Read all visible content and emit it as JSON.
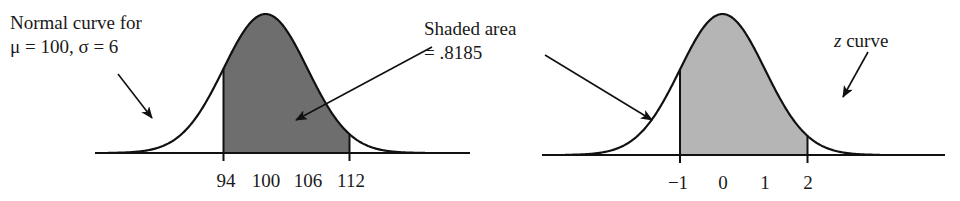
{
  "chart_data": [
    {
      "type": "area",
      "title": "Normal curve for μ = 100, σ = 6",
      "annotation_lines": [
        "Normal curve for",
        "μ = 100, σ = 6"
      ],
      "distribution": "normal",
      "mu": 100,
      "sigma": 6,
      "shaded_interval": [
        94,
        112
      ],
      "shaded_area": 0.8185,
      "shade_color": "#6e6e6e",
      "xlabel": "",
      "ylabel": "",
      "x_ticks": [
        94,
        100,
        106,
        112
      ],
      "x_tick_labels": [
        "94",
        "100",
        "106",
        "112"
      ],
      "grid": false,
      "legend": "none"
    },
    {
      "type": "area",
      "title": "z curve",
      "annotation_lines": [
        "z curve"
      ],
      "distribution": "standard normal",
      "mu": 0,
      "sigma": 1,
      "shaded_interval": [
        -1,
        2
      ],
      "shaded_area": 0.8185,
      "shade_color": "#b5b5b5",
      "xlabel": "",
      "ylabel": "",
      "x_ticks": [
        -1,
        0,
        1,
        2
      ],
      "x_tick_labels": [
        "−1",
        "0",
        "1",
        "2"
      ],
      "grid": false,
      "legend": "none"
    }
  ],
  "annotations": {
    "left_label_line1": "Normal curve for",
    "left_label_line2": "μ = 100, σ = 6",
    "shaded_label_line1": "Shaded area",
    "shaded_label_line2": "= .8185",
    "z_label_italic": "z",
    "z_label_rest": " curve"
  },
  "colors": {
    "curve": "#111111",
    "axis": "#111111",
    "shade_left": "#6e6e6e",
    "shade_right": "#b5b5b5",
    "background": "#ffffff"
  },
  "layout": {
    "left": {
      "axis_x0": 95,
      "axis_x1": 470,
      "baseline_y": 153,
      "center_x": 265.5,
      "px_per_sigma": 42,
      "peak_y": 14,
      "curve_x0": 108,
      "curve_x1": 425
    },
    "right": {
      "axis_x0": 542,
      "axis_x1": 945,
      "baseline_y": 155,
      "center_x": 722.5,
      "px_per_sigma": 42.5,
      "peak_y": 14,
      "curve_x0": 565,
      "curve_x1": 880
    }
  }
}
